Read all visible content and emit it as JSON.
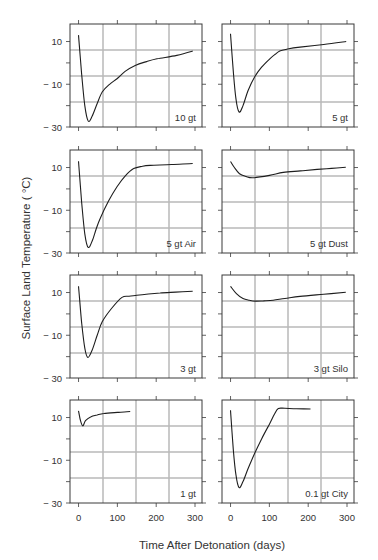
{
  "figure": {
    "ylabel": "Surface Land Temperature ( °C)",
    "xlabel": "Time After Detonation (days)",
    "colors": {
      "frame": "#3a3a3a",
      "grid": "#b8b8b8",
      "curve": "#1e1e1e",
      "text": "#333333"
    }
  },
  "axes": {
    "x_ticks": [
      0,
      100,
      200,
      300
    ],
    "x_tick_labels": [
      "0",
      "100",
      "200",
      "300"
    ],
    "y_ticks": [
      10,
      0,
      -10,
      -20,
      -30
    ],
    "y_tick_labels": {
      "10": "10",
      "-10": "− 10",
      "-30": "− 30"
    },
    "xlim": [
      -22,
      318
    ],
    "ylim": [
      -30,
      18.2
    ]
  },
  "chart_data": [
    {
      "type": "line",
      "title": "10 gt",
      "row": 0,
      "col": 0,
      "x": [
        0,
        8,
        16,
        25,
        35,
        48,
        61,
        80,
        99,
        120,
        146,
        175,
        202,
        253,
        294
      ],
      "y": [
        13,
        -5,
        -20,
        -27.2,
        -25,
        -19,
        -13.6,
        -10,
        -7.4,
        -4,
        -1.2,
        0.6,
        1.9,
        3.5,
        5.5
      ],
      "xlabel": "Time After Detonation (days)",
      "ylabel": "Surface Land Temperature (°C)",
      "ylim": [
        -30,
        18
      ]
    },
    {
      "type": "line",
      "title": "5 gt",
      "row": 0,
      "col": 1,
      "x": [
        0,
        7,
        14,
        22,
        32,
        45,
        62,
        80,
        101,
        115,
        127,
        150,
        179,
        240,
        298
      ],
      "y": [
        13.6,
        -4,
        -17,
        -23,
        -20,
        -13,
        -6.6,
        -2,
        1.9,
        4,
        5.5,
        6.6,
        7.4,
        8.6,
        10
      ],
      "xlabel": "Time After Detonation (days)",
      "ylabel": "Surface Land Temperature (°C)",
      "ylim": [
        -30,
        18
      ]
    },
    {
      "type": "line",
      "title": "5 gt Air",
      "row": 1,
      "col": 0,
      "x": [
        0,
        8,
        16,
        25,
        36,
        45,
        56,
        78,
        99,
        120,
        142,
        165,
        185,
        240,
        294
      ],
      "y": [
        12.9,
        -6,
        -21,
        -27.4,
        -24,
        -19,
        -13.7,
        -5.5,
        1,
        6,
        9.5,
        10.6,
        11,
        11.4,
        11.9
      ],
      "xlabel": "Time After Detonation (days)",
      "ylabel": "Surface Land Temperature (°C)",
      "ylim": [
        -30,
        18
      ]
    },
    {
      "type": "line",
      "title": "5 gt Dust",
      "row": 1,
      "col": 1,
      "x": [
        0,
        10,
        23,
        40,
        58,
        100,
        136,
        180,
        223,
        260,
        297
      ],
      "y": [
        12.8,
        10,
        7.1,
        5.8,
        5.2,
        6.3,
        7.7,
        8.4,
        9.1,
        9.6,
        10.1
      ],
      "xlabel": "Time After Detonation (days)",
      "ylabel": "Surface Land Temperature (°C)",
      "ylim": [
        -30,
        18
      ]
    },
    {
      "type": "line",
      "title": "3 gt",
      "row": 2,
      "col": 0,
      "x": [
        0,
        8,
        16,
        24,
        35,
        48,
        61,
        85,
        112,
        130,
        150,
        180,
        210,
        250,
        294
      ],
      "y": [
        12.9,
        -4,
        -16,
        -20.4,
        -17,
        -10,
        -3.7,
        2.5,
        7.7,
        8.3,
        8.7,
        9.3,
        9.8,
        10.2,
        10.6
      ],
      "xlabel": "Time After Detonation (days)",
      "ylabel": "Surface Land Temperature (°C)",
      "ylim": [
        -30,
        18
      ]
    },
    {
      "type": "line",
      "title": "3 gt Silo",
      "row": 2,
      "col": 1,
      "x": [
        0,
        15,
        32,
        48,
        63,
        85,
        110,
        140,
        179,
        240,
        297
      ],
      "y": [
        12.9,
        9.5,
        7.2,
        6.4,
        6,
        6.1,
        6.4,
        7.2,
        8.2,
        9.2,
        10.1
      ],
      "xlabel": "Time After Detonation (days)",
      "ylabel": "Surface Land Temperature (°C)",
      "ylim": [
        -30,
        18
      ]
    },
    {
      "type": "line",
      "title": "1 gt",
      "row": 3,
      "col": 0,
      "x": [
        0,
        5,
        11,
        18,
        31,
        48,
        65,
        100,
        133
      ],
      "y": [
        13.1,
        8.5,
        6.1,
        8.5,
        10.3,
        11.2,
        11.9,
        12.4,
        12.8
      ],
      "xlabel": "Time After Detonation (days)",
      "ylabel": "Surface Land Temperature (°C)",
      "ylim": [
        -30,
        18
      ]
    },
    {
      "type": "line",
      "title": "0.1 gt City",
      "row": 3,
      "col": 1,
      "x": [
        0,
        7,
        14,
        22,
        32,
        45,
        62,
        80,
        101,
        113,
        123,
        140,
        170,
        206
      ],
      "y": [
        13.4,
        -5,
        -17,
        -22.8,
        -20,
        -14,
        -6.8,
        0,
        7.2,
        11.5,
        14.2,
        14.3,
        14.1,
        14
      ],
      "xlabel": "Time After Detonation (days)",
      "ylabel": "Surface Land Temperature (°C)",
      "ylim": [
        -30,
        18
      ]
    }
  ]
}
